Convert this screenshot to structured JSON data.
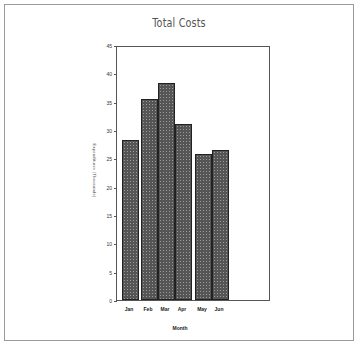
{
  "chart_data": {
    "type": "bar",
    "title": "Total Costs",
    "xlabel": "Month",
    "ylabel": "Expenditures (Thousands)",
    "categories": [
      "Jan",
      "Feb",
      "Mar",
      "Apr",
      "May",
      "Jun"
    ],
    "values": [
      28.2,
      35.5,
      38.3,
      31.1,
      25.7,
      26.4
    ],
    "ylim": [
      0,
      45
    ],
    "yticks": [
      0,
      5,
      10,
      15,
      20,
      25,
      30,
      35,
      40,
      45
    ],
    "grid": false,
    "legend": null,
    "bar_color": "#555555"
  }
}
